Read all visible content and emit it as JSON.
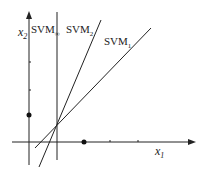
{
  "diagram": {
    "axes": {
      "x_label": "x",
      "x_sub": "1",
      "y_label": "x",
      "y_sub": "2"
    },
    "lines": [
      {
        "name": "SVM",
        "sub": "∞",
        "kind": "vertical"
      },
      {
        "name": "SVM",
        "sub": "2",
        "kind": "steep"
      },
      {
        "name": "SVM",
        "sub": "1",
        "kind": "shallow"
      }
    ],
    "points": [
      {
        "label": "point-on-x2-axis"
      },
      {
        "label": "point-on-x1-axis"
      }
    ],
    "colors": {
      "line": "#222222",
      "background": "#ffffff"
    }
  }
}
